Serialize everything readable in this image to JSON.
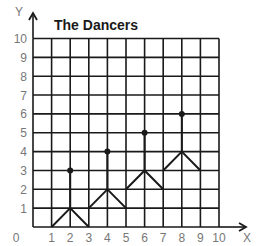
{
  "chart_data": {
    "type": "line",
    "title": "The Dancers",
    "xlabel": "X",
    "ylabel": "Y",
    "xlim": [
      0,
      10
    ],
    "ylim": [
      0,
      10
    ],
    "grid": true,
    "x_ticks": [
      "0",
      "1",
      "2",
      "3",
      "4",
      "5",
      "6",
      "7",
      "8",
      "9",
      "10"
    ],
    "y_ticks": [
      "1",
      "2",
      "3",
      "4",
      "5",
      "6",
      "7",
      "8",
      "9",
      "10"
    ],
    "origin_label": "0",
    "series": [
      {
        "name": "dancer-1-legs",
        "points": [
          [
            1,
            0
          ],
          [
            2,
            1
          ],
          [
            3,
            0
          ]
        ]
      },
      {
        "name": "dancer-1-body",
        "points": [
          [
            2,
            1
          ],
          [
            2,
            3
          ]
        ]
      },
      {
        "name": "dancer-2-legs",
        "points": [
          [
            3,
            1
          ],
          [
            4,
            2
          ],
          [
            5,
            1
          ]
        ]
      },
      {
        "name": "dancer-2-body",
        "points": [
          [
            4,
            2
          ],
          [
            4,
            4
          ]
        ]
      },
      {
        "name": "dancer-3-legs",
        "points": [
          [
            5,
            2
          ],
          [
            6,
            3
          ],
          [
            7,
            2
          ]
        ]
      },
      {
        "name": "dancer-3-body",
        "points": [
          [
            6,
            3
          ],
          [
            6,
            5
          ]
        ]
      },
      {
        "name": "dancer-4-legs",
        "points": [
          [
            7,
            3
          ],
          [
            8,
            4
          ],
          [
            9,
            3
          ]
        ]
      },
      {
        "name": "dancer-4-body",
        "points": [
          [
            8,
            4
          ],
          [
            8,
            6
          ]
        ]
      }
    ],
    "heads": [
      [
        2,
        3
      ],
      [
        4,
        4
      ],
      [
        6,
        5
      ],
      [
        8,
        6
      ]
    ]
  },
  "colors": {
    "grid": "#1a1a1a",
    "tick_label": "#777777",
    "figure": "#1a1a1a"
  }
}
